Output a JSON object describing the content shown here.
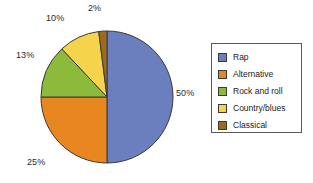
{
  "chart_data": {
    "type": "pie",
    "title": "",
    "subtitle": "",
    "xlabel": "",
    "ylabel": "",
    "categories": [
      "Rap",
      "Alternative",
      "Rock and roll",
      "Country/blues",
      "Classical"
    ],
    "values": [
      50,
      25,
      13,
      10,
      2
    ],
    "value_unit": "%",
    "data_labels": [
      "50%",
      "25%",
      "13%",
      "10%",
      "2%"
    ],
    "colors": [
      "#6B7FBE",
      "#E8871F",
      "#8CBB3C",
      "#F5D34A",
      "#9C6B1E"
    ],
    "slice_border_color": "#3a3a3a",
    "start_angle_deg": 0,
    "direction": "clockwise",
    "grid": false,
    "legend": {
      "position": "right",
      "bordered": true,
      "entries": [
        {
          "label": "Rap",
          "color": "#6B7FBE"
        },
        {
          "label": "Alternative",
          "color": "#E8871F"
        },
        {
          "label": "Rock and roll",
          "color": "#8CBB3C"
        },
        {
          "label": "Country/blues",
          "color": "#F5D34A"
        },
        {
          "label": "Classical",
          "color": "#9C6B1E"
        }
      ]
    },
    "slices": [
      {
        "label": "Rap",
        "value": 50,
        "data_label": "50%",
        "color": "#6B7FBE"
      },
      {
        "label": "Alternative",
        "value": 25,
        "data_label": "25%",
        "color": "#E8871F"
      },
      {
        "label": "Rock and roll",
        "value": 13,
        "data_label": "13%",
        "color": "#8CBB3C"
      },
      {
        "label": "Country/blues",
        "value": 10,
        "data_label": "10%",
        "color": "#F5D34A"
      },
      {
        "label": "Classical",
        "value": 2,
        "data_label": "2%",
        "color": "#9C6B1E"
      }
    ]
  },
  "labels": {
    "rap": "50%",
    "alternative": "25%",
    "rock_and_roll": "13%",
    "country_blues": "10%",
    "classical": "2%"
  }
}
